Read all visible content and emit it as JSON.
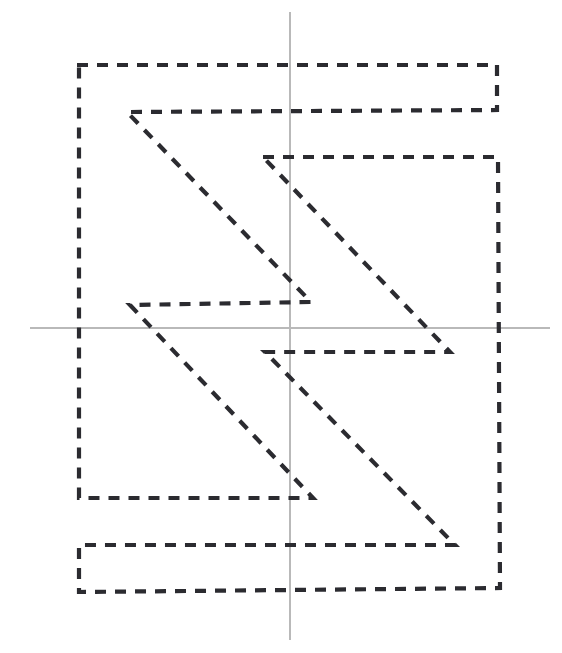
{
  "canvas": {
    "width": 562,
    "height": 653,
    "background": "#ffffff"
  },
  "axes": {
    "color": "#b9b9b9",
    "stroke_width": 1.4,
    "x_axis": {
      "label": "horizontal-axis",
      "y": 328,
      "x_start": 30,
      "x_end": 550
    },
    "y_axis": {
      "label": "vertical-axis",
      "x": 290,
      "y_start": 12,
      "y_end": 640
    },
    "origin": {
      "x": 290,
      "y": 328
    }
  },
  "shape": {
    "name": "dashed-zigzag-outline",
    "style": "dashed",
    "closed": true,
    "stroke_color": "#2b2b30",
    "stroke_width": 4.2,
    "dash_pattern": "11 9",
    "points": [
      [
        77,
        65
      ],
      [
        497,
        65
      ],
      [
        497,
        110
      ],
      [
        127,
        112
      ],
      [
        311,
        302
      ],
      [
        130,
        305
      ],
      [
        313,
        498
      ],
      [
        79,
        498
      ],
      [
        79,
        65
      ]
    ],
    "points_second": [
      [
        263,
        157
      ],
      [
        498,
        157
      ],
      [
        500,
        588
      ],
      [
        79,
        592
      ],
      [
        79,
        545
      ],
      [
        455,
        545
      ],
      [
        265,
        352
      ],
      [
        450,
        352
      ],
      [
        263,
        157
      ]
    ],
    "description": "Two interlocking dashed zigzag (Z-shaped) outlines forming a figure centered on a pair of light gray coordinate axes"
  },
  "chart_data": {
    "type": "line",
    "title": "",
    "xlabel": "",
    "ylabel": "",
    "grid": false,
    "legend": null,
    "annotations": [],
    "series": [
      {
        "name": "outline-upper",
        "closed": true,
        "dashed": true,
        "points": [
          [
            77,
            65
          ],
          [
            497,
            65
          ],
          [
            497,
            110
          ],
          [
            127,
            112
          ],
          [
            311,
            302
          ],
          [
            130,
            305
          ],
          [
            313,
            498
          ],
          [
            79,
            498
          ],
          [
            79,
            65
          ]
        ]
      },
      {
        "name": "outline-lower",
        "closed": true,
        "dashed": true,
        "points": [
          [
            263,
            157
          ],
          [
            498,
            157
          ],
          [
            500,
            588
          ],
          [
            79,
            592
          ],
          [
            79,
            545
          ],
          [
            455,
            545
          ],
          [
            265,
            352
          ],
          [
            450,
            352
          ],
          [
            263,
            157
          ]
        ]
      }
    ]
  }
}
